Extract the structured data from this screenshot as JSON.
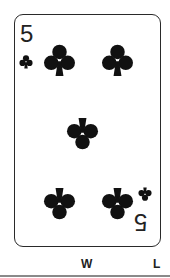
{
  "card": {
    "rank": "5",
    "suit": "clubs",
    "suit_icon": "club-icon",
    "color": "#111111",
    "pip_count": 5
  },
  "labels": {
    "w": "W",
    "l": "L"
  }
}
